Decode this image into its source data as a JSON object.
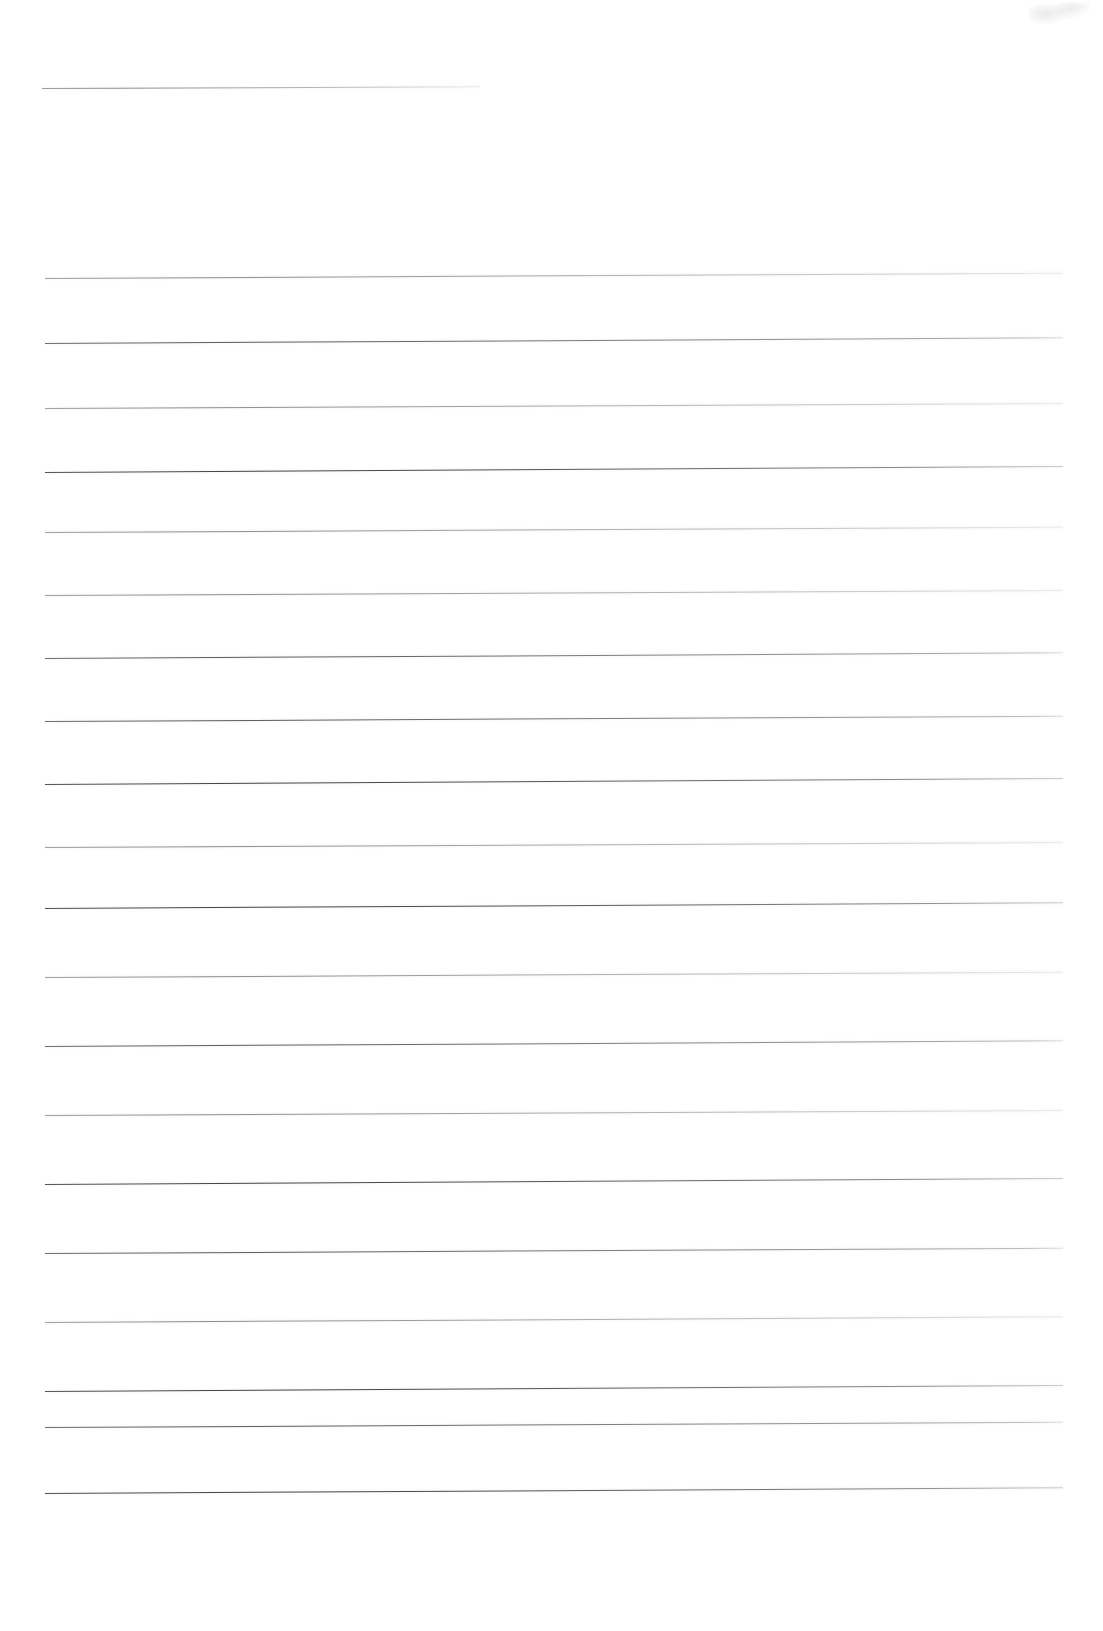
{
  "document": {
    "kind": "scanned-lined-notebook-page",
    "page_width": 1103,
    "page_height": 1631,
    "background_color": "#fdfdfd",
    "rule_color": "#5a5c62",
    "text_content": "",
    "header_note": "",
    "body_note": ""
  },
  "header_rule": {
    "x": 42,
    "y": 88,
    "length": 438,
    "skew_deg": -0.22,
    "weight": "light"
  },
  "rules": [
    {
      "x": 45,
      "y": 278,
      "length": 1018,
      "skew_deg": -0.3,
      "weight": "light"
    },
    {
      "x": 45,
      "y": 343,
      "length": 1018,
      "skew_deg": -0.32,
      "weight": "normal"
    },
    {
      "x": 45,
      "y": 408,
      "length": 1018,
      "skew_deg": -0.28,
      "weight": "light"
    },
    {
      "x": 45,
      "y": 472,
      "length": 1018,
      "skew_deg": -0.34,
      "weight": "heavy"
    },
    {
      "x": 45,
      "y": 532,
      "length": 1018,
      "skew_deg": -0.3,
      "weight": "light"
    },
    {
      "x": 45,
      "y": 595,
      "length": 1018,
      "skew_deg": -0.28,
      "weight": "light"
    },
    {
      "x": 45,
      "y": 658,
      "length": 1018,
      "skew_deg": -0.32,
      "weight": "normal"
    },
    {
      "x": 45,
      "y": 721,
      "length": 1018,
      "skew_deg": -0.3,
      "weight": "normal"
    },
    {
      "x": 45,
      "y": 784,
      "length": 1018,
      "skew_deg": -0.34,
      "weight": "heavy"
    },
    {
      "x": 45,
      "y": 847,
      "length": 1018,
      "skew_deg": -0.28,
      "weight": "light"
    },
    {
      "x": 45,
      "y": 908,
      "length": 1018,
      "skew_deg": -0.32,
      "weight": "heavy"
    },
    {
      "x": 45,
      "y": 977,
      "length": 1018,
      "skew_deg": -0.3,
      "weight": "light"
    },
    {
      "x": 45,
      "y": 1046,
      "length": 1018,
      "skew_deg": -0.32,
      "weight": "normal"
    },
    {
      "x": 45,
      "y": 1115,
      "length": 1018,
      "skew_deg": -0.28,
      "weight": "light"
    },
    {
      "x": 45,
      "y": 1184,
      "length": 1018,
      "skew_deg": -0.34,
      "weight": "heavy"
    },
    {
      "x": 45,
      "y": 1253,
      "length": 1018,
      "skew_deg": -0.3,
      "weight": "normal"
    },
    {
      "x": 45,
      "y": 1322,
      "length": 1018,
      "skew_deg": -0.32,
      "weight": "light"
    },
    {
      "x": 45,
      "y": 1391,
      "length": 1018,
      "skew_deg": -0.34,
      "weight": "heavy"
    },
    {
      "x": 45,
      "y": 1427,
      "length": 1018,
      "skew_deg": -0.3,
      "weight": "normal"
    },
    {
      "x": 45,
      "y": 1493,
      "length": 1018,
      "skew_deg": -0.32,
      "weight": "heavy"
    }
  ],
  "artifacts": [
    {
      "name": "top-right-smudge",
      "x": 1029,
      "y": 2,
      "width": 60,
      "height": 26
    }
  ]
}
